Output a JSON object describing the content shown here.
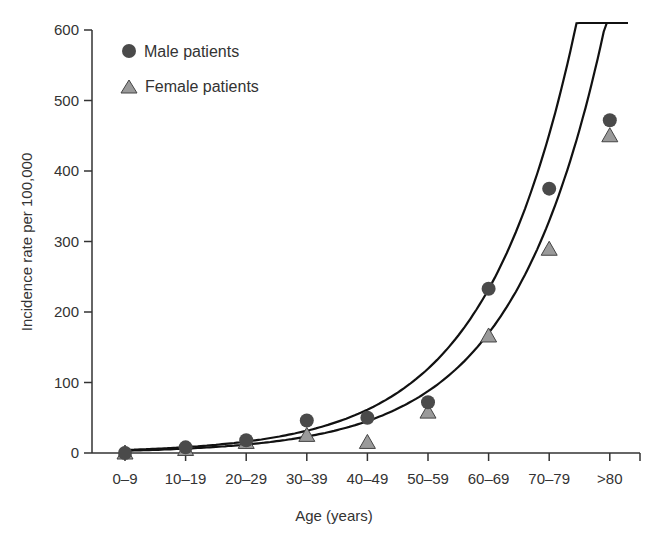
{
  "chart_data": {
    "type": "scatter",
    "title": "",
    "xlabel": "Age (years)",
    "ylabel": "Incidence rate per 100,000",
    "categories": [
      "0–9",
      "10–19",
      "20–29",
      "30–39",
      "40–49",
      "50–59",
      "60–69",
      "70–79",
      ">80"
    ],
    "yticks": [
      "0",
      "100",
      "200",
      "300",
      "400",
      "500",
      "600"
    ],
    "ylim": [
      0,
      600
    ],
    "grid": false,
    "legend_position": "top-left",
    "series": [
      {
        "name": "Male patients",
        "marker": "circle",
        "color": "#4a4a4a",
        "values": [
          0,
          8,
          18,
          46,
          50,
          72,
          233,
          375,
          472
        ],
        "trendline": "exponential"
      },
      {
        "name": "Female patients",
        "marker": "triangle",
        "color": "#9a9a9a",
        "values": [
          0,
          5,
          15,
          25,
          15,
          58,
          166,
          289,
          450
        ],
        "trendline": "exponential"
      }
    ]
  },
  "legend": {
    "male_label": "Male patients",
    "female_label": "Female patients"
  },
  "axes": {
    "x_title": "Age (years)",
    "y_title": "Incidence rate per 100,000"
  }
}
